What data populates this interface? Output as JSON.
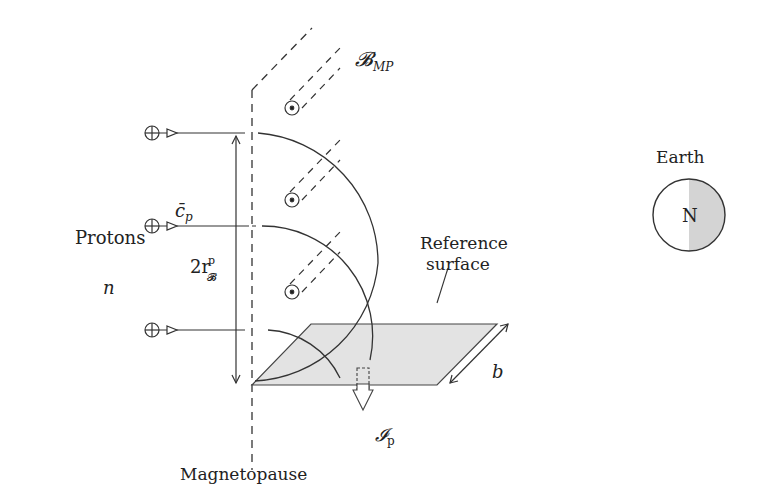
{
  "labels": {
    "protons": "Protons",
    "density": "n",
    "velocity": "c̄",
    "velocity_sub": "p",
    "radius_prefix": "2r",
    "radius_sup": "p",
    "radius_sub": "𝓑",
    "field": "𝓑",
    "field_sub": "MP",
    "reference_line1": "Reference",
    "reference_line2": "surface",
    "width": "b",
    "current": "𝓘",
    "current_sub": "p",
    "magnetopause": "Magnetopause",
    "earth": "Earth",
    "north": "N"
  },
  "colors": {
    "line": "#333333",
    "surface_fill": "#e0e0e0",
    "earth_shade": "#d4d4d4"
  }
}
